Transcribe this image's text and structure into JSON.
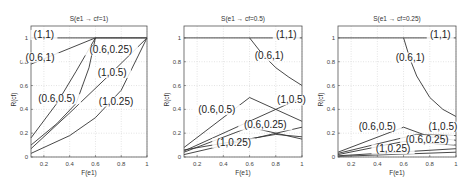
{
  "chart_data": [
    {
      "type": "line",
      "title": "S(e1 → cf=1)",
      "xlabel": "F(e1)",
      "ylabel": "R(cf)",
      "xlim": [
        0.1,
        1.0
      ],
      "ylim": [
        0,
        1.1
      ],
      "xticks": [
        "0.2",
        "0.4",
        "0.6",
        "0.8",
        "1"
      ],
      "yticks": [
        "0",
        "0.2",
        "0.4",
        "0.6",
        "0.8",
        "1"
      ],
      "grid": true,
      "series": [
        {
          "name": "(1,1)",
          "x": [
            0.1,
            1.0
          ],
          "y": [
            1.0,
            1.0
          ]
        },
        {
          "name": "(0.6,1)",
          "x": [
            0.1,
            0.6,
            1.0
          ],
          "y": [
            0.78,
            1.0,
            1.0
          ]
        },
        {
          "name": "(0.6,0.5)",
          "x": [
            0.1,
            0.3,
            0.45,
            0.6
          ],
          "y": [
            0.16,
            0.45,
            0.72,
            1.0
          ]
        },
        {
          "name": "(0.6,0.25)",
          "x": [
            0.1,
            0.3,
            0.45,
            0.55,
            0.6
          ],
          "y": [
            0.1,
            0.28,
            0.45,
            0.75,
            1.0
          ]
        },
        {
          "name": "(1,0.5)",
          "x": [
            0.1,
            0.4,
            0.7,
            1.0
          ],
          "y": [
            0.07,
            0.37,
            0.68,
            1.0
          ]
        },
        {
          "name": "(1,0.25)",
          "x": [
            0.1,
            0.4,
            0.6,
            0.8,
            1.0
          ],
          "y": [
            0.03,
            0.18,
            0.33,
            0.56,
            1.0
          ]
        }
      ],
      "labels": [
        {
          "text": "(1,1)",
          "x": 0.2,
          "y": 1.0
        },
        {
          "text": "(0.6,1)",
          "x": 0.17,
          "y": 0.81
        },
        {
          "text": "(0.6,0.25)",
          "x": 0.72,
          "y": 0.87
        },
        {
          "text": "(1,0.5)",
          "x": 0.73,
          "y": 0.68
        },
        {
          "text": "(0.6,0.5)",
          "x": 0.3,
          "y": 0.46
        },
        {
          "text": "(1,0.25)",
          "x": 0.76,
          "y": 0.44
        }
      ]
    },
    {
      "type": "line",
      "title": "S(e1 → cf=0.5)",
      "xlabel": "F(e1)",
      "ylabel": "R(cf)",
      "xlim": [
        0.1,
        1.0
      ],
      "ylim": [
        0,
        1.1
      ],
      "xticks": [
        "0.2",
        "0.4",
        "0.6",
        "0.8",
        "1"
      ],
      "yticks": [
        "0",
        "0.2",
        "0.4",
        "0.6",
        "0.8",
        "1"
      ],
      "grid": true,
      "series": [
        {
          "name": "(1,1)",
          "x": [
            0.1,
            1.0
          ],
          "y": [
            1.0,
            1.0
          ]
        },
        {
          "name": "(0.6,1)",
          "x": [
            0.6,
            0.7,
            0.8,
            0.9,
            1.0
          ],
          "y": [
            1.0,
            0.86,
            0.75,
            0.67,
            0.6
          ]
        },
        {
          "name": "(0.6,0.5)",
          "x": [
            0.1,
            0.6,
            1.0
          ],
          "y": [
            0.08,
            0.5,
            0.3
          ]
        },
        {
          "name": "(1,0.5)",
          "x": [
            0.1,
            1.0
          ],
          "y": [
            0.05,
            0.5
          ]
        },
        {
          "name": "(0.6,0.25)",
          "x": [
            0.1,
            0.6,
            1.0
          ],
          "y": [
            0.04,
            0.25,
            0.15
          ]
        },
        {
          "name": "(1,0.25)",
          "x": [
            0.1,
            1.0
          ],
          "y": [
            0.02,
            0.25
          ]
        },
        {
          "name": "(0.6,0.5) lower",
          "x": [
            0.1,
            0.8,
            1.0
          ],
          "y": [
            0.06,
            0.19,
            0.17
          ]
        }
      ],
      "labels": [
        {
          "text": "(1,1)",
          "x": 0.88,
          "y": 1.0
        },
        {
          "text": "(0.6,1)",
          "x": 0.75,
          "y": 0.82
        },
        {
          "text": "(0.6,0.5)",
          "x": 0.35,
          "y": 0.37
        },
        {
          "text": "(1,0.5)",
          "x": 0.92,
          "y": 0.45
        },
        {
          "text": "(0.6,0.25)",
          "x": 0.72,
          "y": 0.24
        },
        {
          "text": "(1,0.25)",
          "x": 0.48,
          "y": 0.09
        }
      ]
    },
    {
      "type": "line",
      "title": "S(e1 → cf=0.25)",
      "xlabel": "F(e1)",
      "ylabel": "R(cf)",
      "xlim": [
        0.1,
        1.0
      ],
      "ylim": [
        0,
        1.1
      ],
      "xticks": [
        "0.2",
        "0.4",
        "0.6",
        "0.8",
        "1"
      ],
      "yticks": [
        "0",
        "0.2",
        "0.4",
        "0.6",
        "0.8",
        "1"
      ],
      "grid": true,
      "series": [
        {
          "name": "(1,1)",
          "x": [
            0.1,
            1.0
          ],
          "y": [
            1.0,
            1.0
          ]
        },
        {
          "name": "(0.6,1)",
          "x": [
            0.6,
            0.65,
            0.7,
            0.8,
            0.9,
            1.0
          ],
          "y": [
            1.0,
            0.82,
            0.68,
            0.5,
            0.4,
            0.34
          ]
        },
        {
          "name": "(0.6,0.5)",
          "x": [
            0.1,
            0.6,
            0.8,
            1.0
          ],
          "y": [
            0.04,
            0.25,
            0.17,
            0.14
          ]
        },
        {
          "name": "(1,0.5)",
          "x": [
            0.1,
            0.7,
            1.0
          ],
          "y": [
            0.03,
            0.19,
            0.18
          ]
        },
        {
          "name": "(0.6,0.25)",
          "x": [
            0.1,
            0.6,
            1.0
          ],
          "y": [
            0.02,
            0.13,
            0.1
          ]
        },
        {
          "name": "(1,0.25)",
          "x": [
            0.1,
            1.0
          ],
          "y": [
            0.01,
            0.07
          ]
        },
        {
          "name": "(1,0.25) lower",
          "x": [
            0.1,
            1.0
          ],
          "y": [
            0.005,
            0.04
          ]
        }
      ],
      "labels": [
        {
          "text": "(1,1)",
          "x": 0.88,
          "y": 1.0
        },
        {
          "text": "(0.6,1)",
          "x": 0.65,
          "y": 0.81
        },
        {
          "text": "(0.6,0.5)",
          "x": 0.4,
          "y": 0.23
        },
        {
          "text": "(1,0.5)",
          "x": 0.9,
          "y": 0.23
        },
        {
          "text": "(0.6,0.25)",
          "x": 0.78,
          "y": 0.12
        },
        {
          "text": "(1,0.25)",
          "x": 0.52,
          "y": 0.04
        }
      ]
    }
  ],
  "panels": [
    {
      "title": "S(e1 → cf=1)",
      "xlabel": "F(e1)",
      "ylabel": "R(cf)"
    },
    {
      "title": "S(e1 → cf=0.5)",
      "xlabel": "F(e1)",
      "ylabel": "R(cf)"
    },
    {
      "title": "S(e1 → cf=0.25)",
      "xlabel": "F(e1)",
      "ylabel": "R(cf)"
    }
  ]
}
